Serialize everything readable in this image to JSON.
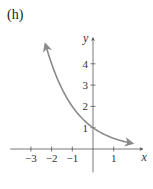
{
  "panel_label": "(h)",
  "chart_data": {
    "type": "line",
    "title": "",
    "function": "y = (1/2)^x",
    "xlabel": "x",
    "ylabel": "y",
    "xlim": [
      -4,
      2.2
    ],
    "ylim": [
      -1,
      5.5
    ],
    "x_ticks": [
      -3,
      -2,
      -1,
      1
    ],
    "x_tick_labels": [
      "−3",
      "−2",
      "−1",
      "1"
    ],
    "y_ticks": [
      1,
      2,
      3,
      4
    ],
    "y_tick_labels": [
      "1",
      "2",
      "3",
      "4"
    ],
    "grid": false,
    "series": [
      {
        "name": "curve",
        "color": "#8a8a8a",
        "x": [
          -2.3,
          -2,
          -1.5,
          -1,
          -0.5,
          0,
          0.5,
          1,
          1.5,
          1.9
        ],
        "y": [
          4.92,
          4,
          2.83,
          2,
          1.41,
          1,
          0.71,
          0.5,
          0.35,
          0.27
        ],
        "arrows": "both"
      }
    ]
  }
}
